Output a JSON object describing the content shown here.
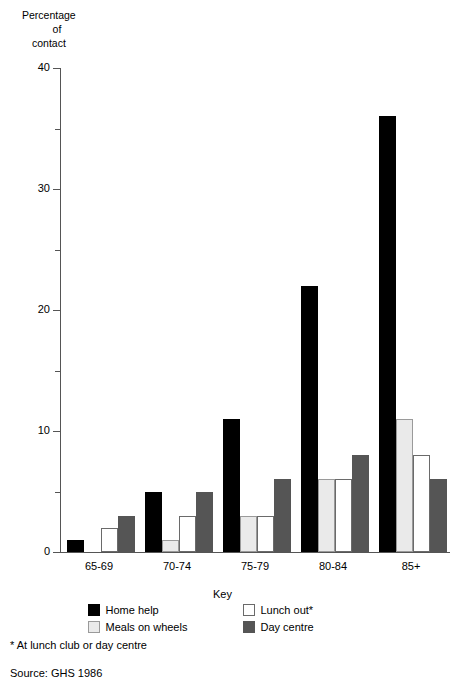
{
  "chart_data": {
    "type": "bar",
    "title": "",
    "ylabel": "Percentage of contact",
    "xlabel": "",
    "ylim": [
      0,
      40
    ],
    "yticks": [
      0,
      10,
      20,
      30,
      40
    ],
    "yticks_minor": [
      5,
      15,
      25,
      35
    ],
    "grid": false,
    "legend_position": "bottom",
    "categories": [
      "65-69",
      "70-74",
      "75-79",
      "80-84",
      "85+"
    ],
    "series": [
      {
        "name": "Home help",
        "swatch": "black",
        "color": "#000000",
        "values": [
          1,
          5,
          11,
          22,
          36
        ]
      },
      {
        "name": "Meals on wheels",
        "swatch": "light",
        "color": "#eaeaea",
        "values": [
          0,
          1,
          3,
          6,
          11
        ]
      },
      {
        "name": "Lunch out*",
        "swatch": "white",
        "color": "#ffffff",
        "values": [
          2,
          3,
          3,
          6,
          8
        ]
      },
      {
        "name": "Day centre",
        "swatch": "dark",
        "color": "#555555",
        "values": [
          3,
          5,
          6,
          8,
          6
        ]
      }
    ],
    "annotations": [
      "* At lunch club or day centre",
      "Source: GHS 1986"
    ]
  },
  "y_axis": {
    "title_lines": [
      "Percentage",
      "of",
      "contact"
    ],
    "tick_labels": [
      "0",
      "10",
      "20",
      "30",
      "40"
    ]
  },
  "x_axis": {
    "categories": [
      "65-69",
      "70-74",
      "75-79",
      "80-84",
      "85+"
    ]
  },
  "legend": {
    "title": "Key",
    "items": [
      {
        "label": "Home help",
        "swatch": "black"
      },
      {
        "label": "Lunch out*",
        "swatch": "white"
      },
      {
        "label": "Meals on wheels",
        "swatch": "light"
      },
      {
        "label": "Day centre",
        "swatch": "dark"
      }
    ]
  },
  "notes": {
    "asterisk": "* At lunch club or day centre",
    "source": "Source: GHS 1986"
  }
}
